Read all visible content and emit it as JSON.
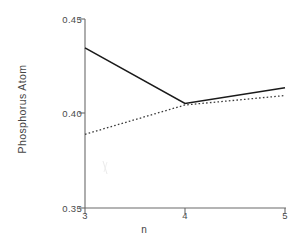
{
  "chart_data": {
    "type": "line",
    "title": "",
    "xlabel": "n",
    "ylabel": "Charge Density at Substituted\nPhosphorus Atom",
    "ylabel_lines": [
      "Charge Density at Substituted",
      "Phosphorus Atom"
    ],
    "x": [
      3,
      4,
      5
    ],
    "xlim": [
      3,
      5
    ],
    "ylim": [
      0.35,
      0.45
    ],
    "xticks": [
      "3",
      "4",
      "5"
    ],
    "yticks": [
      "0.45",
      "0.40",
      "0.35"
    ],
    "ytick_values": [
      0.45,
      0.4,
      0.35
    ],
    "xtick_values": [
      3,
      4,
      5
    ],
    "grid": false,
    "legend": "none",
    "series": [
      {
        "name": "solid",
        "style": "solid",
        "color": "#1a1a1a",
        "values": [
          0.4347,
          0.4053,
          0.4136
        ]
      },
      {
        "name": "dotted",
        "style": "dotted",
        "color": "#3a3a3a",
        "values": [
          0.389,
          0.4045,
          0.4095
        ]
      }
    ]
  },
  "axes": {
    "y_title_line1": "Charge Density at Substituted",
    "y_title_line2": "Phosphorus Atom",
    "x_title": "n",
    "ytick_0": "0.45",
    "ytick_1": "0.40",
    "ytick_2": "0.35",
    "xtick_0": "3",
    "xtick_1": "4",
    "xtick_2": "5"
  },
  "colors": {
    "axis": "#6b6b6b",
    "solid_line": "#1a1a1a",
    "dotted_line": "#3a3a3a",
    "text": "#444444",
    "background": "#ffffff"
  }
}
